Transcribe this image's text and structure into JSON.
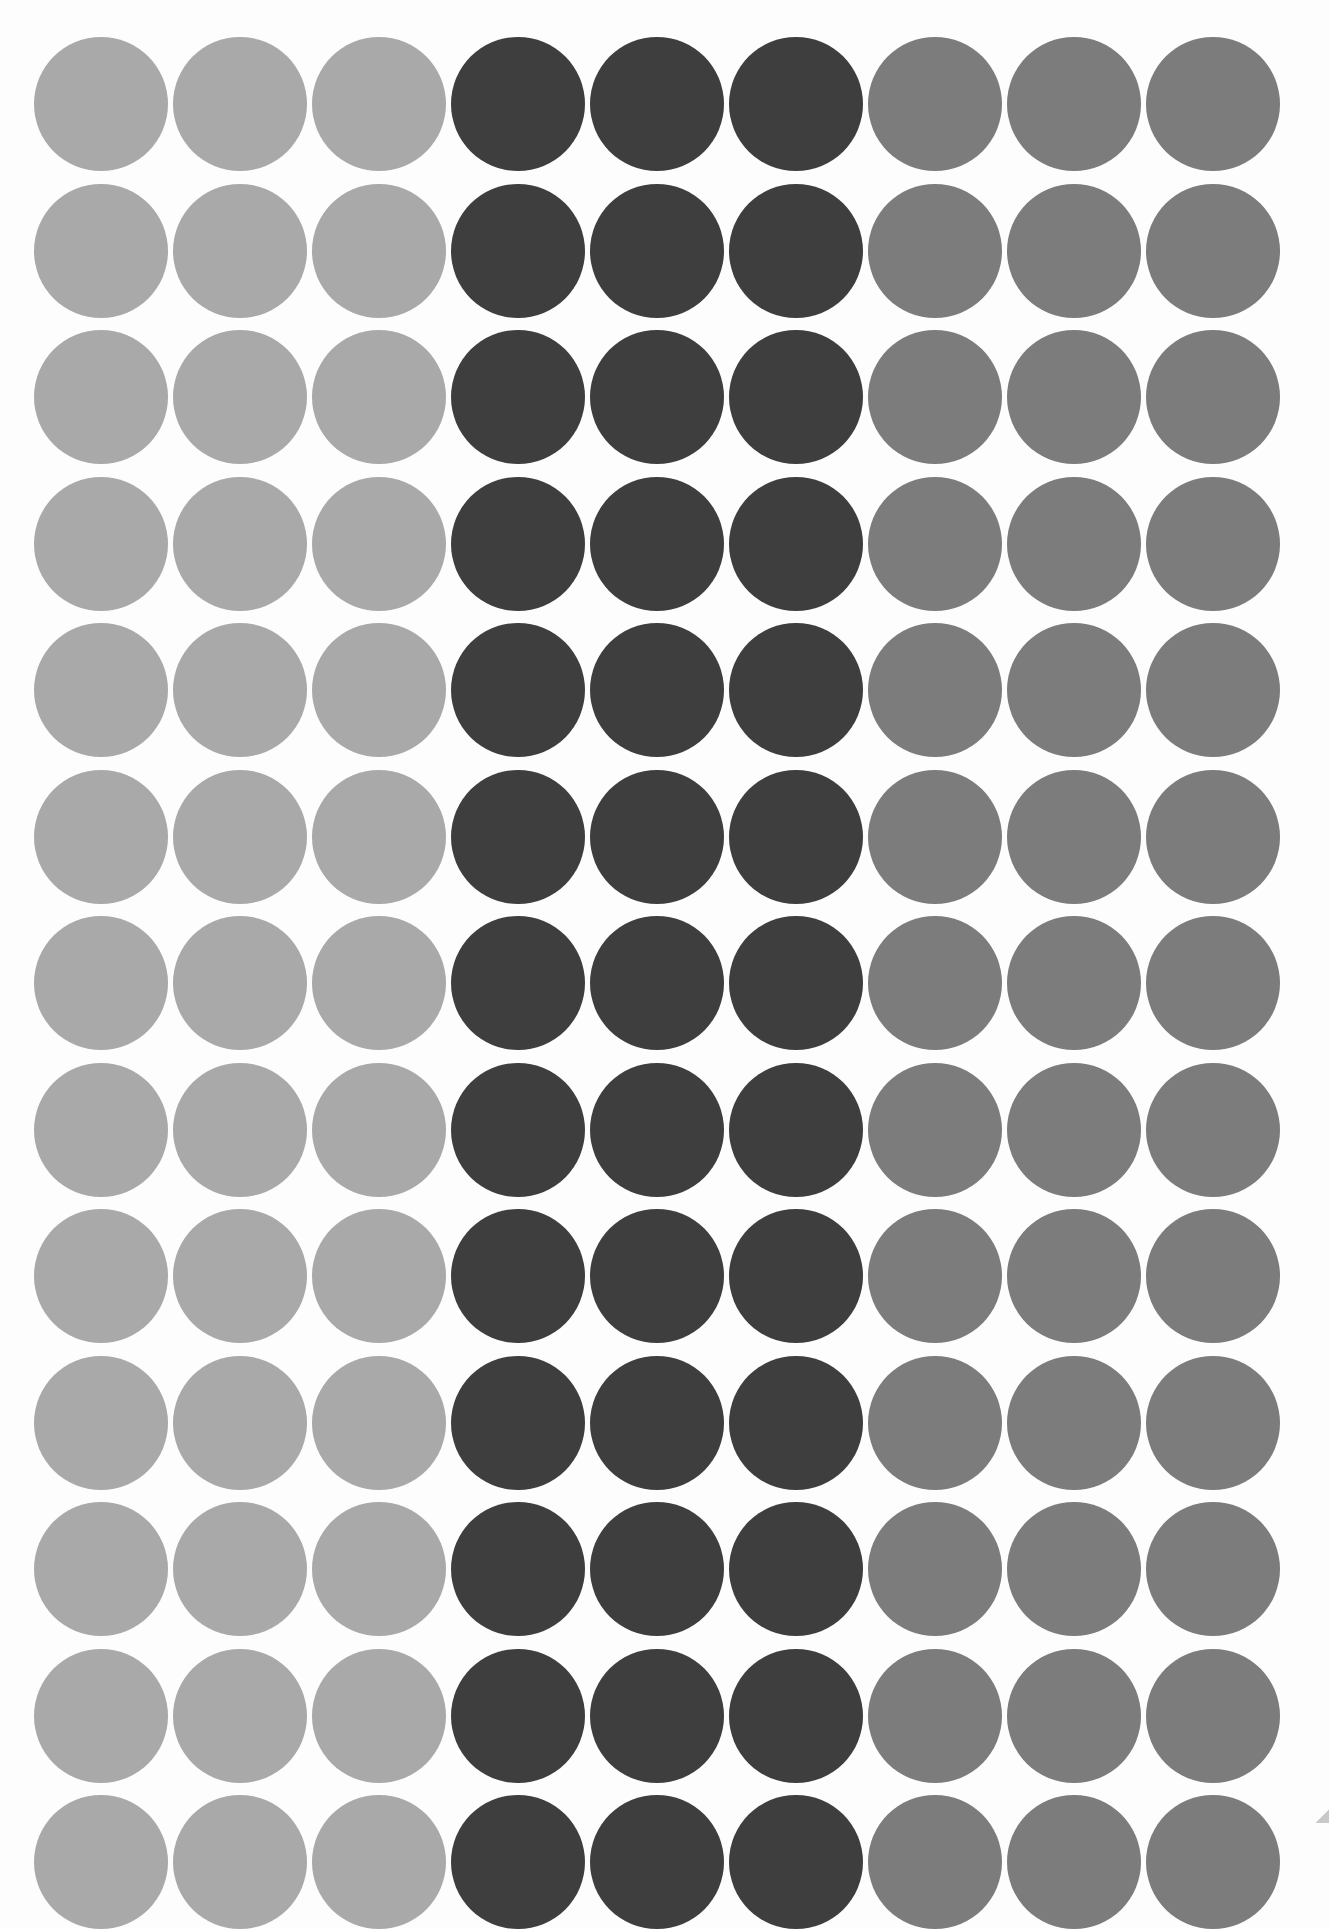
{
  "sheet": {
    "description": "Sheet of round sticker dots",
    "columns": 9,
    "rows": 13,
    "groups": [
      {
        "name": "light-gray",
        "color": "#a9a9a9",
        "columns": [
          0,
          1,
          2
        ]
      },
      {
        "name": "dark-gray",
        "color": "#3e3e3e",
        "columns": [
          3,
          4,
          5
        ]
      },
      {
        "name": "medium-gray",
        "color": "#7c7c7c",
        "columns": [
          6,
          7,
          8
        ]
      }
    ],
    "column_colors": [
      "#a9a9a9",
      "#a9a9a9",
      "#a9a9a9",
      "#3e3e3e",
      "#3e3e3e",
      "#3e3e3e",
      "#7c7c7c",
      "#7c7c7c",
      "#7c7c7c"
    ],
    "layout": {
      "first_x": 34,
      "first_y": 37,
      "col_pitch": 139,
      "row_pitch": 146.5,
      "diameter": 134
    }
  }
}
